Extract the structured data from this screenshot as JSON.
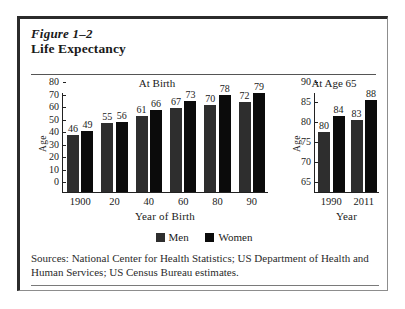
{
  "figure": {
    "number": "Figure 1–2",
    "title": "Life Expectancy",
    "sources": "Sources:  National Center for Health Statistics; US Department of Health and Human Services; US Census Bureau estimates."
  },
  "legend": {
    "men": "Men",
    "women": "Women"
  },
  "colors": {
    "men": "#2e2e2e",
    "women": "#0b0b0b",
    "frame": "#2b2b2b",
    "background": "#ffffff"
  },
  "chart_data": [
    {
      "type": "bar",
      "title": "At Birth",
      "xlabel": "Year of Birth",
      "ylabel": "Age",
      "ylim": [
        0,
        80
      ],
      "yticks": [
        0,
        10,
        20,
        30,
        40,
        50,
        60,
        70,
        80
      ],
      "ytick_labels": [
        "0",
        "10",
        "20",
        "30",
        "40",
        "50",
        "60",
        "70",
        "80"
      ],
      "categories": [
        "1900",
        "20",
        "40",
        "60",
        "80",
        "90"
      ],
      "grid": false,
      "legend_position": "bottom-center",
      "series": [
        {
          "name": "Men",
          "values": [
            46,
            55,
            61,
            67,
            70,
            72
          ]
        },
        {
          "name": "Women",
          "values": [
            49,
            56,
            66,
            73,
            78,
            79
          ]
        }
      ]
    },
    {
      "type": "bar",
      "title": "At Age 65",
      "xlabel": "Year",
      "ylabel": "Age",
      "ylim": [
        65,
        90
      ],
      "yticks": [
        65,
        70,
        75,
        80,
        85,
        90
      ],
      "ytick_labels": [
        "65",
        "70",
        "75",
        "80",
        "85",
        "90"
      ],
      "categories": [
        "1990",
        "2011"
      ],
      "grid": false,
      "legend_position": "bottom-center",
      "series": [
        {
          "name": "Men",
          "values": [
            80,
            83
          ]
        },
        {
          "name": "Women",
          "values": [
            84,
            88
          ]
        }
      ]
    }
  ]
}
